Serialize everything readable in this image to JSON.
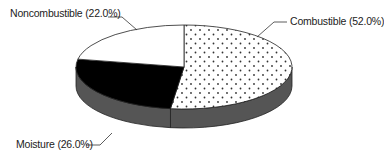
{
  "chart_data": {
    "type": "pie",
    "style": "3d-exploded-none",
    "title": "",
    "categories": [
      "Combustible",
      "Moisture",
      "Noncombustible"
    ],
    "values": [
      52.0,
      26.0,
      22.0
    ],
    "unit": "%",
    "labels": [
      "Combustible (52.0%)",
      "Moisture (26.0%)",
      "Noncombustible (22.0%)"
    ],
    "fills": [
      {
        "name": "Combustible",
        "pattern": "dots",
        "color": "#ffffff",
        "dot_color": "#333333"
      },
      {
        "name": "Moisture",
        "pattern": "solid",
        "color": "#000000"
      },
      {
        "name": "Noncombustible",
        "pattern": "solid",
        "color": "#ffffff"
      }
    ],
    "side_color": "#555555",
    "start_angle_deg": -90,
    "direction": "clockwise",
    "legend": "none (leader-line labels)"
  }
}
